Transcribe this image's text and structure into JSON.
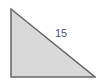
{
  "diagram": {
    "shape": "right-triangle",
    "fill_color": "#d9d9d9",
    "stroke_color": "#666666",
    "vertices": [
      [
        11,
        9
      ],
      [
        11,
        77
      ],
      [
        95,
        77
      ]
    ],
    "labels": {
      "hypotenuse": "15"
    }
  }
}
